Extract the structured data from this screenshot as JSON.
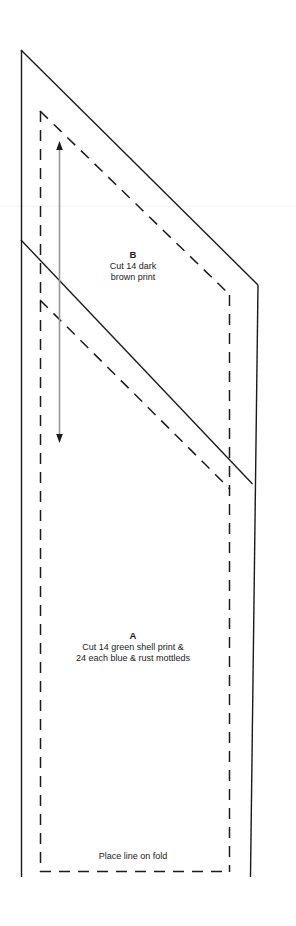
{
  "document": {
    "kind": "sewing-pattern-template",
    "background_color": "#ffffff",
    "line_color": "#1a1a1a",
    "width": 296,
    "height": 926
  },
  "pieces": [
    {
      "id": "B",
      "title": "B",
      "instruction_line_1": "Cut 14 dark",
      "instruction_line_2": "brown print"
    },
    {
      "id": "A",
      "title": "A",
      "instruction_line_1": "Cut 14 green shell print &",
      "instruction_line_2": "24 each blue & rust mottleds"
    }
  ],
  "annotations": {
    "fold_note": "Place line on fold",
    "grainline_name": "grainline-arrow"
  },
  "geometry": {
    "solid_outline": "M 21,50 L 258,285 L 250,877 M 21,50 L 21,877",
    "solid_divider": "M 21,240 L 252,484",
    "dashed_outline": "M 40,111 L 230,295 L 230,872 L 40,872 Z",
    "dashed_divider": "M 40,300 L 230,489",
    "grainline": {
      "x": 59,
      "y_top": 143,
      "y_bottom": 441
    }
  }
}
